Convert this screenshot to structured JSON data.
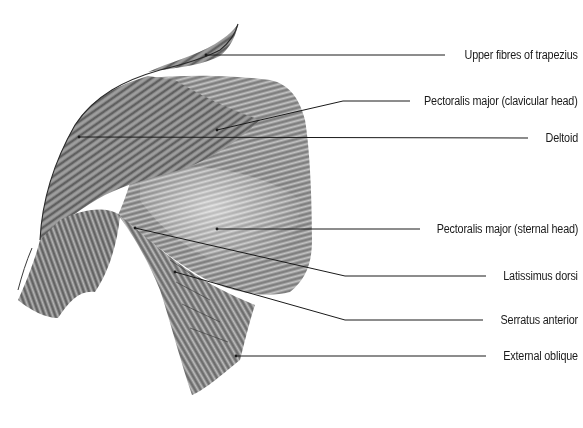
{
  "figure": {
    "colors": {
      "background": "#ffffff",
      "leader_line": "#1a1a1a",
      "label_text": "#1a1a1a",
      "muscle_dark": "#3a3a3a",
      "muscle_mid": "#7a7a7a",
      "muscle_light": "#c8c8c8"
    },
    "labels": [
      {
        "id": "trapezius",
        "text": "Upper fibres of trapezius",
        "text_y": 55,
        "text_right": 578,
        "anchor": [
          206,
          55
        ],
        "bend": null,
        "line_end_x": 445
      },
      {
        "id": "pec-clavicular",
        "text": "Pectoralis major (clavicular head)",
        "text_y": 101,
        "text_right": 578,
        "anchor": [
          217,
          130
        ],
        "bend": [
          343,
          101
        ],
        "line_end_x": 410
      },
      {
        "id": "deltoid",
        "text": "Deltoid",
        "text_y": 138,
        "text_right": 578,
        "anchor": [
          79,
          137
        ],
        "bend": null,
        "line_end_x": 528
      },
      {
        "id": "pec-sternal",
        "text": "Pectoralis major (sternal head)",
        "text_y": 229,
        "text_right": 578,
        "anchor": [
          217,
          229
        ],
        "bend": null,
        "line_end_x": 420
      },
      {
        "id": "latissimus",
        "text": "Latissimus dorsi",
        "text_y": 276,
        "text_right": 578,
        "anchor": [
          135,
          228
        ],
        "bend": [
          345,
          276
        ],
        "line_end_x": 486
      },
      {
        "id": "serratus",
        "text": "Serratus anterior",
        "text_y": 320,
        "text_right": 578,
        "anchor": [
          175,
          272
        ],
        "bend": [
          345,
          320
        ],
        "line_end_x": 483
      },
      {
        "id": "external-oblique",
        "text": "External oblique",
        "text_y": 356,
        "text_right": 578,
        "anchor": [
          236,
          356
        ],
        "bend": null,
        "line_end_x": 486
      }
    ]
  }
}
